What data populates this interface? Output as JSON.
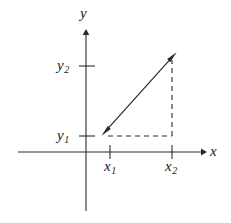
{
  "figure": {
    "type": "coordinate-axes-vector-diagram",
    "background_color": "#ffffff",
    "stroke_color": "#2b2b2b",
    "axes": {
      "origin": {
        "x": 86,
        "y": 152
      },
      "x_axis": {
        "label": "x",
        "label_text": "x",
        "start_x": 18,
        "end_x": 205,
        "y": 152,
        "has_arrowhead": true,
        "arrow_direction": "right"
      },
      "y_axis": {
        "label": "y",
        "label_text": "y",
        "top_y": 30,
        "bottom_y": 211,
        "x": 86,
        "has_arrowhead": true,
        "arrow_direction": "up"
      }
    },
    "ticks": {
      "x": [
        {
          "name": "x1",
          "label": "x",
          "subscript": "1",
          "pos_x": 110
        },
        {
          "name": "x2",
          "label": "x",
          "subscript": "2",
          "pos_x": 172
        }
      ],
      "y": [
        {
          "name": "y2",
          "label": "y",
          "subscript": "2",
          "pos_y": 66
        },
        {
          "name": "y1",
          "label": "y",
          "subscript": "1",
          "pos_y": 136
        }
      ]
    },
    "vector": {
      "name": "double-headed-vector",
      "from": {
        "x": 103,
        "y": 134
      },
      "to": {
        "x": 175,
        "y": 54
      },
      "double_headed": true
    },
    "guides": [
      {
        "name": "horizontal-dashed-guide",
        "orientation": "horizontal",
        "from": {
          "x": 108,
          "y": 136
        },
        "to": {
          "x": 172,
          "y": 136
        },
        "style": "dashed"
      },
      {
        "name": "vertical-dashed-guide",
        "orientation": "vertical",
        "from": {
          "x": 172,
          "y": 60
        },
        "to": {
          "x": 172,
          "y": 136
        },
        "style": "dashed"
      }
    ]
  }
}
